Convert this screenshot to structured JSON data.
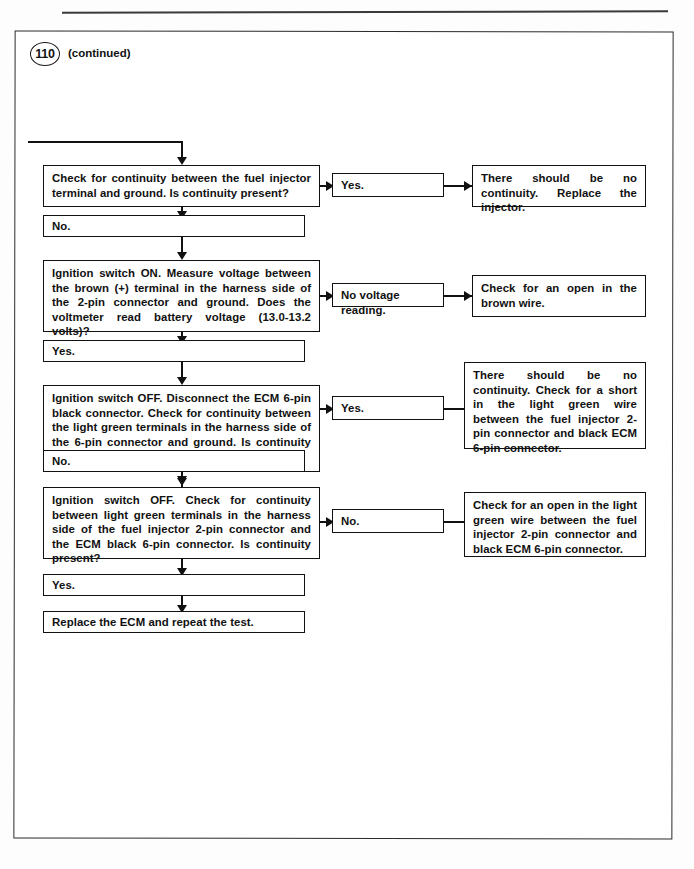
{
  "page": {
    "running_head": "",
    "step_number": "110",
    "continued_label": "(continued)"
  },
  "flowchart": {
    "type": "troubleshooting-flowchart",
    "steps": [
      {
        "id": "step-1",
        "question": "Check for continuity between the fuel injector terminal and ground. Is continuity present?",
        "branch_label": "Yes.",
        "branch_result": "There should be no continuity. Replace the injector.",
        "fallthrough_label": "No."
      },
      {
        "id": "step-2",
        "question": "Ignition switch ON. Measure voltage between the brown (+) terminal in the harness side of the 2-pin connector and ground. Does the voltmeter read battery voltage (13.0-13.2 volts)?",
        "branch_label": "No voltage reading.",
        "branch_result": "Check for an open in the brown wire.",
        "fallthrough_label": "Yes."
      },
      {
        "id": "step-3",
        "question": "Ignition switch OFF. Disconnect the ECM 6-pin black connector. Check for continuity between the light green terminals in the harness side of the 6-pin connector and ground. Is continuity present?",
        "branch_label": "Yes.",
        "branch_result": "There should be no continuity. Check for a short in the light green wire between the fuel injector 2-pin connector and black ECM 6-pin connector.",
        "fallthrough_label": "No."
      },
      {
        "id": "step-4",
        "question": "Ignition switch OFF. Check for continuity between light green terminals in the harness side of the fuel injector 2-pin connector and the ECM black 6-pin connector. Is continuity present?",
        "branch_label": "No.",
        "branch_result": "Check for an open in the light green wire between the fuel injector 2-pin connector and black ECM 6-pin connector.",
        "fallthrough_label": "Yes."
      }
    ],
    "conclusion": "Replace the ECM and repeat the test."
  }
}
